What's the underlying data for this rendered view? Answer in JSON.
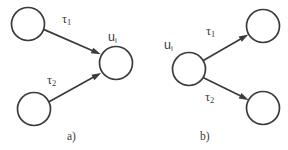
{
  "figure": {
    "width": 288,
    "height": 150,
    "background_color": "#ffffff",
    "stroke_color": "#3b3b3b",
    "panels": [
      {
        "id": "a",
        "caption": "a)",
        "caption_x": 67,
        "caption_y": 140,
        "description": "two source nodes converge into one target node",
        "nodes": [
          {
            "id": "a-source-1",
            "cx": 28,
            "cy": 24,
            "r": 16.5,
            "label": "",
            "label_sub": ""
          },
          {
            "id": "a-source-2",
            "cx": 34,
            "cy": 109,
            "r": 16.5,
            "label": "",
            "label_sub": ""
          },
          {
            "id": "a-target",
            "cx": 116,
            "cy": 63,
            "r": 16.5,
            "label": "u",
            "label_sub": "i",
            "label_x": 108,
            "label_y": 41
          }
        ],
        "edges": [
          {
            "id": "a-edge-1",
            "from": "a-source-1",
            "to": "a-target",
            "label": "τ",
            "label_sub": "1",
            "label_x": 62,
            "label_y": 23,
            "x1": 43.6,
            "y1": 29.4,
            "x2": 100.8,
            "y2": 54.3
          },
          {
            "id": "a-edge-2",
            "from": "a-source-2",
            "to": "a-target",
            "label": "τ",
            "label_sub": "2",
            "label_x": 47,
            "label_y": 84,
            "x1": 48.6,
            "y1": 101.9,
            "x2": 101.2,
            "y2": 72.9
          }
        ]
      },
      {
        "id": "b",
        "caption": "b)",
        "caption_x": 200,
        "caption_y": 140,
        "description": "one source node diverges into two target nodes",
        "nodes": [
          {
            "id": "b-source",
            "cx": 189,
            "cy": 69,
            "r": 16.5,
            "label": "u",
            "label_sub": "i",
            "label_x": 164,
            "label_y": 49
          },
          {
            "id": "b-target-1",
            "cx": 263,
            "cy": 26,
            "r": 16.5,
            "label": "",
            "label_sub": ""
          },
          {
            "id": "b-target-2",
            "cx": 263,
            "cy": 108,
            "r": 16.5,
            "label": "",
            "label_sub": ""
          }
        ],
        "edges": [
          {
            "id": "b-edge-1",
            "from": "b-source",
            "to": "b-target-1",
            "label": "τ",
            "label_sub": "1",
            "label_x": 206,
            "label_y": 35,
            "x1": 203.3,
            "y1": 60.6,
            "x2": 248.4,
            "y2": 34.4
          },
          {
            "id": "b-edge-2",
            "from": "b-source",
            "to": "b-target-2",
            "label": "τ",
            "label_sub": "2",
            "label_x": 205,
            "label_y": 101,
            "x1": 203.5,
            "y1": 77.7,
            "x2": 248.6,
            "y2": 99.9
          }
        ]
      }
    ]
  }
}
